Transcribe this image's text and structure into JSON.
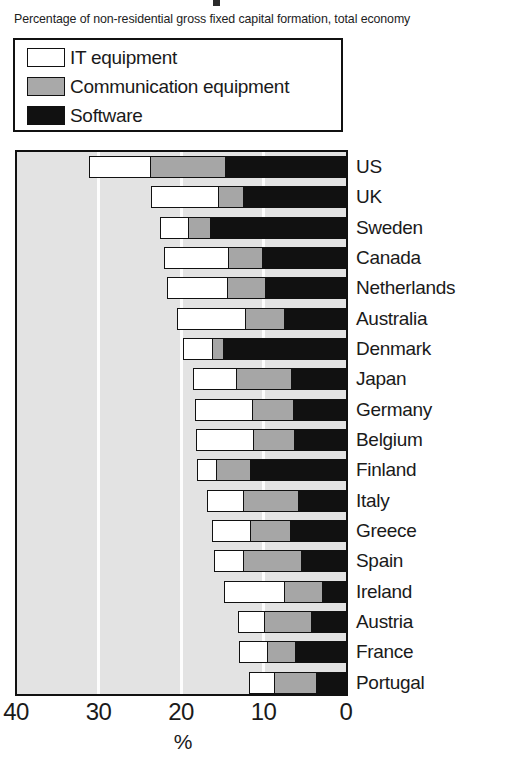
{
  "subtitle": "Percentage of non-residential gross fixed capital formation, total economy",
  "legend": {
    "items": [
      {
        "label": "IT equipment",
        "swatch": "white-square-icon",
        "color": "#ffffff"
      },
      {
        "label": "Communication equipment",
        "swatch": "gray-square-icon",
        "color": "#a9a9a9"
      },
      {
        "label": "Software",
        "swatch": "black-square-icon",
        "color": "#111111"
      }
    ]
  },
  "axis": {
    "ticks": [
      "40",
      "30",
      "20",
      "10",
      "0"
    ],
    "tick_values": [
      40,
      30,
      20,
      10,
      0
    ],
    "label": "%",
    "reversed": true
  },
  "chart_data": {
    "type": "bar",
    "orientation": "horizontal",
    "stacked": true,
    "title": "",
    "subtitle": "Percentage of non-residential gross fixed capital formation, total economy",
    "xlabel": "%",
    "ylabel": "",
    "xlim": [
      40,
      0
    ],
    "xticks": [
      40,
      30,
      20,
      10,
      0
    ],
    "grid": "vertical-white-gridlines-at-30-20-10",
    "legend_position": "above-plot-boxed",
    "categories": [
      "US",
      "UK",
      "Sweden",
      "Canada",
      "Netherlands",
      "Australia",
      "Denmark",
      "Japan",
      "Germany",
      "Belgium",
      "Finland",
      "Italy",
      "Greece",
      "Spain",
      "Ireland",
      "Austria",
      "France",
      "Portugal"
    ],
    "series": [
      {
        "name": "IT equipment",
        "color": "#ffffff",
        "values": [
          7.4,
          8.2,
          3.4,
          7.9,
          7.3,
          8.4,
          3.5,
          5.2,
          7.0,
          7.0,
          2.4,
          4.5,
          4.7,
          3.6,
          7.4,
          3.2,
          3.5,
          3.1
        ]
      },
      {
        "name": "Communication equipment",
        "color": "#a9a9a9",
        "values": [
          9.2,
          3.0,
          2.7,
          4.1,
          4.7,
          4.8,
          1.4,
          6.8,
          5.0,
          5.0,
          4.1,
          6.8,
          5.0,
          7.1,
          4.7,
          5.8,
          3.5,
          5.2
        ]
      },
      {
        "name": "Software",
        "color": "#111111",
        "values": [
          14.5,
          12.4,
          16.4,
          10.1,
          9.7,
          7.3,
          14.8,
          6.5,
          6.3,
          6.2,
          11.6,
          5.6,
          6.6,
          5.3,
          2.7,
          4.1,
          6.0,
          3.5
        ]
      }
    ],
    "totals": [
      31.1,
      23.6,
      22.5,
      22.1,
      21.7,
      20.5,
      19.7,
      18.5,
      18.3,
      18.2,
      18.1,
      16.9,
      16.3,
      16.0,
      14.8,
      13.1,
      13.0,
      11.8
    ]
  }
}
